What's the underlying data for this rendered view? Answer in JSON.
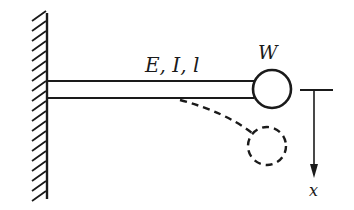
{
  "diagram": {
    "beam_label": "E, I, l",
    "mass_label": "W",
    "axis_label": "x",
    "colors": {
      "ink": "#1a1a1a",
      "background": "#ffffff"
    },
    "elements": {
      "wall": "fixed-support-hatched",
      "beam": "horizontal-beam",
      "mass": "solid-circle-outline",
      "deflected_beam": "dashed-curve",
      "deflected_mass": "dashed-circle",
      "reference_line": "horizontal-datum",
      "displacement_arrow": "downward-arrow"
    }
  }
}
